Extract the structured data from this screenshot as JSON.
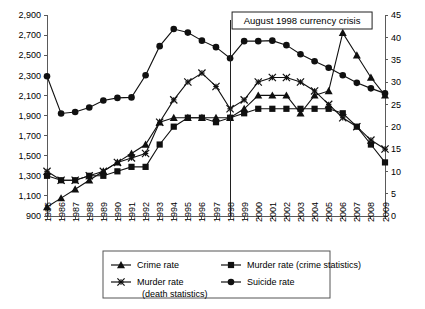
{
  "chart_data": {
    "type": "line",
    "title": "",
    "subtitle": "",
    "xlabel": "",
    "ylabel": "",
    "y2label": "",
    "grid": false,
    "legend_position": "bottom",
    "x": [
      1985,
      1986,
      1987,
      1988,
      1989,
      1990,
      1991,
      1992,
      1993,
      1994,
      1995,
      1996,
      1997,
      1998,
      1999,
      2000,
      2001,
      2002,
      2003,
      2004,
      2005,
      2006,
      2007,
      2008,
      2009
    ],
    "xtick_labels": [
      "1985",
      "1986",
      "1987",
      "1988",
      "1989",
      "1990",
      "1991",
      "1992",
      "1993",
      "1994",
      "1995",
      "1996",
      "1997",
      "1998",
      "1999",
      "2000",
      "2001",
      "2002",
      "2003",
      "2004",
      "2005",
      "2006",
      "2007",
      "2008",
      "2009"
    ],
    "ylim": [
      900,
      2900
    ],
    "ytick_labels": [
      "900",
      "1,100",
      "1,300",
      "1,500",
      "1,700",
      "1,900",
      "2,100",
      "2,300",
      "2,500",
      "2,700",
      "2,900"
    ],
    "ytick_values": [
      900,
      1100,
      1300,
      1500,
      1700,
      1900,
      2100,
      2300,
      2500,
      2700,
      2900
    ],
    "y2lim": [
      0,
      45
    ],
    "y2tick_labels": [
      "0",
      "5",
      "10",
      "15",
      "20",
      "25",
      "30",
      "35",
      "40",
      "45"
    ],
    "y2tick_values": [
      0,
      5,
      10,
      15,
      20,
      25,
      30,
      35,
      40,
      45
    ],
    "series": [
      {
        "name": "Crime rate",
        "marker": "triangle",
        "axis": "right",
        "values": [
          2,
          4,
          6,
          8,
          10,
          12,
          14,
          16,
          21,
          22,
          22,
          22,
          22,
          22,
          24,
          27,
          27,
          27,
          23,
          27,
          28,
          41,
          36,
          31,
          27
        ]
      },
      {
        "name": "Murder rate (crime statistics)",
        "marker": "square",
        "axis": "right",
        "values": [
          9,
          8,
          8,
          9,
          9,
          10,
          11,
          11,
          16,
          20,
          22,
          22,
          21,
          22,
          23,
          24,
          24,
          24,
          24,
          24,
          24,
          23,
          20,
          16,
          12
        ]
      },
      {
        "name": "Murder rate (death statistics)",
        "marker": "x",
        "axis": "right",
        "values": [
          10,
          8,
          8,
          9,
          10,
          12,
          13,
          14,
          21,
          26,
          30,
          32,
          29,
          24,
          26,
          30,
          31,
          31,
          30,
          28,
          25,
          22,
          20,
          17,
          15
        ]
      },
      {
        "name": "Suicide rate",
        "marker": "circle",
        "axis": "left",
        "values": [
          2290,
          1920,
          1935,
          1980,
          2050,
          2075,
          2080,
          2300,
          2590,
          2760,
          2725,
          2645,
          2580,
          2470,
          2640,
          2640,
          2645,
          2600,
          2510,
          2440,
          2375,
          2300,
          2225,
          2170,
          2120
        ]
      }
    ],
    "annotations": [
      {
        "text": "August 1998 currency crisis",
        "x": 1998,
        "type": "vline-with-label-box"
      }
    ],
    "legend": [
      {
        "label": "Crime rate",
        "marker": "triangle"
      },
      {
        "label": "Murder rate (crime statistics)",
        "marker": "square"
      },
      {
        "label": "Murder rate",
        "label2": "(death statistics)",
        "marker": "x"
      },
      {
        "label": "Suicide rate",
        "marker": "circle"
      }
    ]
  }
}
